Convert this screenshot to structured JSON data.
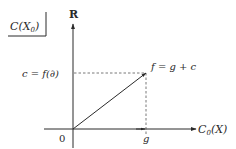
{
  "box_label": "C(X",
  "box_label_sub": "0",
  "y_axis_label": "R",
  "x_axis_label": "C",
  "x_axis_label_sub": "0",
  "x_axis_label_tail": "(X)",
  "c_label": "c = f(∂)",
  "f_label": "f = g + c",
  "origin_label": "0",
  "g_label": "g",
  "colors": {
    "stroke": "#2a2a2a",
    "dashed": "#555555",
    "background": "#ffffff"
  }
}
